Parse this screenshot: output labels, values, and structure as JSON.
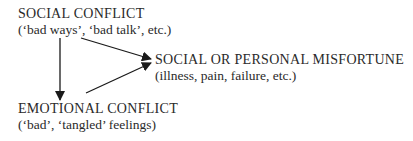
{
  "diagram": {
    "nodes": [
      {
        "id": "social-conflict",
        "title": "SOCIAL CONFLICT",
        "subtitle": "(‘bad ways’, ‘bad talk’, etc.)"
      },
      {
        "id": "misfortune",
        "title": "SOCIAL OR PERSONAL MISFORTUNE",
        "subtitle": "(illness, pain, failure, etc.)"
      },
      {
        "id": "emotional-conflict",
        "title": "EMOTIONAL CONFLICT",
        "subtitle": "(‘bad’, ‘tangled’ feelings)"
      }
    ],
    "edges": [
      {
        "from": "social-conflict",
        "to": "emotional-conflict"
      },
      {
        "from": "social-conflict",
        "to": "misfortune"
      },
      {
        "from": "emotional-conflict",
        "to": "misfortune"
      }
    ],
    "colors": {
      "text": "#2a2a2a",
      "arrow": "#1a1a1a",
      "background": "#ffffff"
    }
  }
}
